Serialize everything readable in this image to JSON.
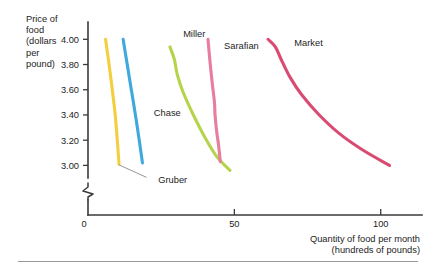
{
  "figure": {
    "background": "#ffffff",
    "bottom_rule_color": "#9a9a9a"
  },
  "chart_data": {
    "type": "line",
    "title": "",
    "xlabel": "Quantity of food per month",
    "xlabel_line2": "(hundreds of pounds)",
    "ylabel": "Price of food (dollars per pound)",
    "ylabel_lines": [
      "Price of",
      "food",
      "(dollars",
      "per",
      "pound)"
    ],
    "xlim": [
      0,
      110
    ],
    "ylim": [
      2.9,
      4.05
    ],
    "xticks": [
      50,
      100
    ],
    "xtick_labels": [
      "50",
      "100"
    ],
    "yticks": [
      3.0,
      3.2,
      3.4,
      3.6,
      3.8,
      4.0
    ],
    "ytick_labels": [
      "3.00",
      "3.20",
      "3.40",
      "3.60",
      "3.80",
      "4.00"
    ],
    "origin_label": "0",
    "grid": false,
    "y_axis_break": true,
    "legend": "inline-labels",
    "series": [
      {
        "name": "Gruber",
        "color": "#f3cf3f",
        "label_x": 24,
        "label_y": 2.86,
        "leader_from": [
          20,
          2.905
        ],
        "leader_to": [
          10.5,
          3.005
        ],
        "points": [
          {
            "x": 6.0,
            "y": 4.0
          },
          {
            "x": 7.2,
            "y": 3.8
          },
          {
            "x": 8.3,
            "y": 3.6
          },
          {
            "x": 9.3,
            "y": 3.4
          },
          {
            "x": 10.0,
            "y": 3.2
          },
          {
            "x": 10.6,
            "y": 3.01
          }
        ]
      },
      {
        "name": "Chase",
        "color": "#3fa9dd",
        "label_x": 22.5,
        "label_y": 3.39,
        "points": [
          {
            "x": 12.0,
            "y": 4.0
          },
          {
            "x": 13.4,
            "y": 3.8
          },
          {
            "x": 14.8,
            "y": 3.6
          },
          {
            "x": 16.2,
            "y": 3.4
          },
          {
            "x": 17.5,
            "y": 3.2
          },
          {
            "x": 18.6,
            "y": 3.02
          }
        ]
      },
      {
        "name": "Miller",
        "color": "#b6d44b",
        "label_x": 32.5,
        "label_y": 4.02,
        "points": [
          {
            "x": 28.0,
            "y": 3.94
          },
          {
            "x": 29.5,
            "y": 3.84
          },
          {
            "x": 30.5,
            "y": 3.72
          },
          {
            "x": 32.5,
            "y": 3.58
          },
          {
            "x": 36.0,
            "y": 3.4
          },
          {
            "x": 40.0,
            "y": 3.22
          },
          {
            "x": 44.0,
            "y": 3.07
          },
          {
            "x": 48.5,
            "y": 2.96
          }
        ]
      },
      {
        "name": "Sarafian",
        "color": "#e87d9e",
        "label_x": 46.5,
        "label_y": 3.92,
        "points": [
          {
            "x": 41.0,
            "y": 4.0
          },
          {
            "x": 41.6,
            "y": 3.84
          },
          {
            "x": 42.4,
            "y": 3.66
          },
          {
            "x": 43.2,
            "y": 3.5
          },
          {
            "x": 43.4,
            "y": 3.4
          },
          {
            "x": 43.9,
            "y": 3.28
          },
          {
            "x": 44.6,
            "y": 3.16
          },
          {
            "x": 45.2,
            "y": 3.03
          }
        ]
      },
      {
        "name": "Market",
        "color": "#d94b72",
        "label_x": 70.5,
        "label_y": 3.95,
        "points": [
          {
            "x": 61.5,
            "y": 4.0
          },
          {
            "x": 64.0,
            "y": 3.94
          },
          {
            "x": 66.0,
            "y": 3.84
          },
          {
            "x": 69.0,
            "y": 3.7
          },
          {
            "x": 73.0,
            "y": 3.56
          },
          {
            "x": 79.0,
            "y": 3.4
          },
          {
            "x": 86.0,
            "y": 3.25
          },
          {
            "x": 94.0,
            "y": 3.12
          },
          {
            "x": 103.0,
            "y": 3.0
          }
        ]
      }
    ]
  }
}
